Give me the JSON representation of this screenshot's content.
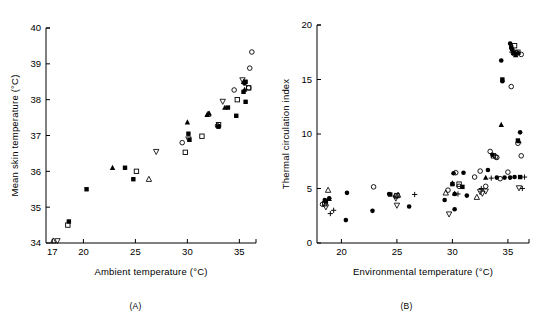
{
  "figure": {
    "panels": [
      {
        "id": "A",
        "caption": "(A)",
        "chart_data": {
          "type": "scatter",
          "title": "",
          "xlabel": "Ambient temperature (°C)",
          "ylabel": "Mean skin temperature (°C)",
          "xlim": [
            16.4,
            36.6
          ],
          "ylim": [
            34,
            40
          ],
          "xticks": [
            17,
            20,
            25,
            30,
            35
          ],
          "yticks": [
            34,
            35,
            36,
            37,
            38,
            39,
            40
          ],
          "grid": false,
          "legend": "none",
          "series": [
            {
              "name": "filled-square",
              "marker": "filled-square",
              "points": [
                [
                  18.6,
                  34.6
                ],
                [
                  20.3,
                  35.5
                ],
                [
                  24.8,
                  35.78
                ],
                [
                  24.0,
                  36.1
                ],
                [
                  30.2,
                  36.88
                ],
                [
                  30.1,
                  37.05
                ],
                [
                  33.0,
                  37.25
                ],
                [
                  34.7,
                  37.55
                ],
                [
                  33.9,
                  37.78
                ],
                [
                  35.6,
                  37.94
                ],
                [
                  35.4,
                  38.22
                ],
                [
                  35.6,
                  38.5
                ]
              ]
            },
            {
              "name": "open-square",
              "marker": "open-square",
              "points": [
                [
                  18.5,
                  34.5
                ],
                [
                  25.1,
                  36.0
                ],
                [
                  29.8,
                  36.53
                ],
                [
                  31.4,
                  36.98
                ],
                [
                  33.0,
                  37.3
                ],
                [
                  34.8,
                  38.0
                ],
                [
                  35.9,
                  38.33
                ]
              ]
            },
            {
              "name": "filled-triangle-up",
              "marker": "filled-triangle-up",
              "points": [
                [
                  22.8,
                  36.1
                ],
                [
                  30.0,
                  37.37
                ],
                [
                  31.9,
                  37.58
                ],
                [
                  32.1,
                  37.62
                ],
                [
                  33.6,
                  37.78
                ],
                [
                  35.5,
                  38.28
                ],
                [
                  35.4,
                  38.5
                ]
              ]
            },
            {
              "name": "open-triangle-up",
              "marker": "open-triangle-up",
              "points": [
                [
                  17.1,
                  34.06
                ],
                [
                  26.3,
                  35.78
                ],
                [
                  32.0,
                  37.6
                ]
              ]
            },
            {
              "name": "open-triangle-down",
              "marker": "open-triangle-down",
              "points": [
                [
                  17.5,
                  34.06
                ],
                [
                  27.0,
                  36.55
                ],
                [
                  30.1,
                  36.9
                ],
                [
                  33.4,
                  37.95
                ],
                [
                  35.3,
                  38.55
                ]
              ]
            },
            {
              "name": "open-circle",
              "marker": "open-circle",
              "points": [
                [
                  29.5,
                  36.8
                ],
                [
                  32.9,
                  37.27
                ],
                [
                  34.5,
                  38.27
                ],
                [
                  36.0,
                  38.88
                ],
                [
                  36.2,
                  39.33
                ],
                [
                  35.9,
                  38.33
                ]
              ]
            },
            {
              "name": "filled-circle",
              "marker": "filled-circle",
              "points": [
                [
                  33.0,
                  37.25
                ],
                [
                  35.5,
                  38.45
                ]
              ]
            }
          ]
        }
      },
      {
        "id": "B",
        "caption": "(B)",
        "chart_data": {
          "type": "scatter",
          "title": "",
          "xlabel": "Environmental temperature (°C)",
          "ylabel": "Thermal circulation index",
          "xlim": [
            17.8,
            36.9
          ],
          "ylim": [
            0,
            20
          ],
          "xticks": [
            20,
            25,
            30,
            35
          ],
          "yticks": [
            0,
            5,
            10,
            15,
            20
          ],
          "grid": false,
          "legend": "none",
          "series": [
            {
              "name": "filled-circle",
              "marker": "filled-circle",
              "points": [
                [
                  18.5,
                  3.95
                ],
                [
                  18.9,
                  4.1
                ],
                [
                  20.5,
                  4.6
                ],
                [
                  20.4,
                  2.1
                ],
                [
                  22.8,
                  2.95
                ],
                [
                  24.3,
                  4.5
                ],
                [
                  26.1,
                  3.35
                ],
                [
                  29.3,
                  3.95
                ],
                [
                  30.1,
                  6.4
                ],
                [
                  30.2,
                  4.5
                ],
                [
                  30.2,
                  3.1
                ],
                [
                  31.0,
                  6.45
                ],
                [
                  31.3,
                  4.35
                ],
                [
                  33.2,
                  6.7
                ],
                [
                  33.6,
                  8.1
                ],
                [
                  34.4,
                  16.75
                ],
                [
                  34.5,
                  14.85
                ],
                [
                  35.2,
                  18.3
                ],
                [
                  35.4,
                  17.75
                ],
                [
                  35.9,
                  17.4
                ],
                [
                  36.1,
                  10.15
                ],
                [
                  34.7,
                  6.0
                ],
                [
                  35.2,
                  6.0
                ],
                [
                  35.6,
                  6.05
                ],
                [
                  34.0,
                  6.0
                ]
              ]
            },
            {
              "name": "open-circle",
              "marker": "open-circle",
              "points": [
                [
                  18.3,
                  3.55
                ],
                [
                  22.9,
                  5.15
                ],
                [
                  24.9,
                  4.3
                ],
                [
                  29.6,
                  4.85
                ],
                [
                  30.3,
                  6.45
                ],
                [
                  30.6,
                  5.2
                ],
                [
                  32.0,
                  6.05
                ],
                [
                  32.5,
                  6.6
                ],
                [
                  33.4,
                  8.4
                ],
                [
                  33.9,
                  7.9
                ],
                [
                  34.0,
                  7.85
                ],
                [
                  35.3,
                  14.35
                ],
                [
                  35.5,
                  17.4
                ],
                [
                  35.8,
                  17.45
                ],
                [
                  36.2,
                  17.3
                ],
                [
                  35.9,
                  9.15
                ],
                [
                  34.3,
                  5.9
                ],
                [
                  33.0,
                  5.2
                ],
                [
                  35.0,
                  6.5
                ],
                [
                  36.2,
                  8.0
                ]
              ]
            },
            {
              "name": "filled-square",
              "marker": "filled-square",
              "points": [
                [
                  18.6,
                  3.8
                ],
                [
                  24.4,
                  4.45
                ],
                [
                  30.0,
                  5.4
                ],
                [
                  30.9,
                  5.15
                ],
                [
                  34.5,
                  15.0
                ],
                [
                  35.3,
                  17.95
                ],
                [
                  35.5,
                  17.45
                ],
                [
                  36.1,
                  6.05
                ],
                [
                  35.9,
                  9.4
                ]
              ]
            },
            {
              "name": "open-square",
              "marker": "open-square",
              "points": [
                [
                  18.5,
                  3.6
                ],
                [
                  25.0,
                  4.35
                ],
                [
                  30.6,
                  5.4
                ],
                [
                  33.7,
                  8.0
                ],
                [
                  35.6,
                  18.1
                ],
                [
                  35.9,
                  17.5
                ]
              ]
            },
            {
              "name": "filled-triangle-up",
              "marker": "filled-triangle-up",
              "points": [
                [
                  18.9,
                  4.05
                ],
                [
                  30.0,
                  5.5
                ],
                [
                  30.2,
                  4.55
                ],
                [
                  33.0,
                  6.0
                ],
                [
                  34.4,
                  10.85
                ],
                [
                  36.0,
                  9.35
                ],
                [
                  35.7,
                  17.25
                ]
              ]
            },
            {
              "name": "open-triangle-up",
              "marker": "open-triangle-up",
              "points": [
                [
                  18.8,
                  4.85
                ],
                [
                  25.1,
                  4.4
                ],
                [
                  29.4,
                  4.6
                ],
                [
                  32.2,
                  4.2
                ],
                [
                  35.4,
                  17.7
                ]
              ]
            },
            {
              "name": "open-triangle-down",
              "marker": "open-triangle-down",
              "points": [
                [
                  18.6,
                  3.3
                ],
                [
                  24.9,
                  4.1
                ],
                [
                  25.0,
                  3.45
                ],
                [
                  29.7,
                  2.65
                ],
                [
                  32.5,
                  4.7
                ],
                [
                  32.7,
                  4.55
                ],
                [
                  33.0,
                  4.75
                ],
                [
                  36.0,
                  5.05
                ]
              ]
            },
            {
              "name": "plus",
              "marker": "plus",
              "points": [
                [
                  19.0,
                  2.7
                ],
                [
                  19.3,
                  3.0
                ],
                [
                  26.6,
                  4.45
                ],
                [
                  30.5,
                  4.5
                ],
                [
                  32.6,
                  5.0
                ],
                [
                  33.5,
                  5.95
                ],
                [
                  36.3,
                  5.0
                ],
                [
                  36.5,
                  6.05
                ]
              ]
            }
          ]
        }
      }
    ]
  }
}
